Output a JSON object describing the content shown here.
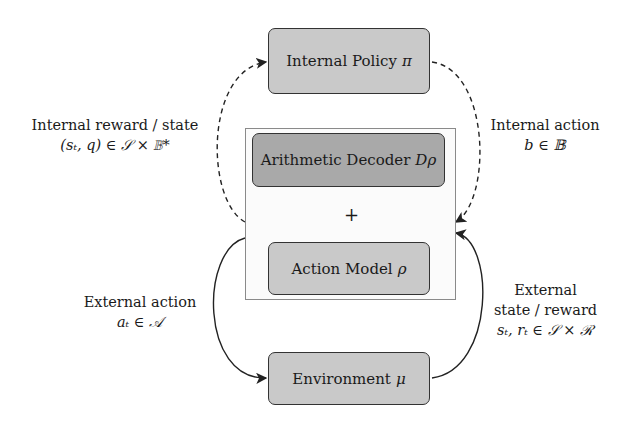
{
  "diagram": {
    "nodes": {
      "policy": {
        "label": "Internal Policy",
        "symbol": "π"
      },
      "decoder": {
        "label": "Arithmetic Decoder",
        "symbol": "Dρ"
      },
      "combiner": "+",
      "action_model": {
        "label": "Action Model",
        "symbol": "ρ"
      },
      "environment": {
        "label": "Environment",
        "symbol": "μ"
      }
    },
    "edges": {
      "internal_reward": {
        "line1": "Internal reward / state",
        "line2": "(sₜ, q) ∈ 𝒮 × 𝔹*"
      },
      "internal_action": {
        "line1": "Internal action",
        "line2": "b ∈ 𝔹"
      },
      "external_action": {
        "line1": "External action",
        "line2": "aₜ ∈ 𝒜"
      },
      "external_state": {
        "line1": "External",
        "line2": "state / reward",
        "line3": "sₜ, rₜ ∈ 𝒮 × ℛ"
      }
    },
    "colors": {
      "light_box": "#c9c9c9",
      "dark_box": "#a9a9a9",
      "stroke": "#333333"
    }
  }
}
